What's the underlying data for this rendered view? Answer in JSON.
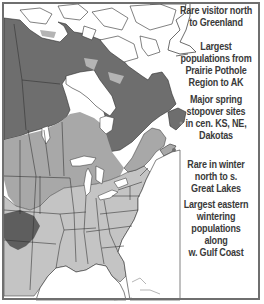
{
  "map": {
    "type": "species-range-map",
    "colors": {
      "water": "#ffffff",
      "non_range_land": "#ffffff",
      "breeding_range": "#6e6e6e",
      "migration_range": "#a8a8a8",
      "winter_range": "#c4c4c4",
      "year_round_dark": "#5a5a5a",
      "borders": "#2e2e2e",
      "frame": "#6f6f6f"
    },
    "annotations": [
      {
        "id": "greenland",
        "text": "Rare visitor north to Greenland"
      },
      {
        "id": "prairie",
        "text": "Largest populations from Prairie Pothole Region to AK"
      },
      {
        "id": "stopover",
        "text": "Major spring stopover sites in cen. KS, NE, Dakotas"
      },
      {
        "id": "great-lakes",
        "text": "Rare in winter north to s. Great Lakes"
      },
      {
        "id": "gulf",
        "text": "Largest eastern wintering populations along w. Gulf Coast"
      }
    ]
  },
  "notes": {
    "greenland_l1": "Rare visitor north",
    "greenland_l2": "to Greenland",
    "prairie_l1": "Largest",
    "prairie_l2": "populations from",
    "prairie_l3": "Prairie Pothole",
    "prairie_l4": "Region to AK",
    "stopover_l1": "Major spring",
    "stopover_l2": "stopover sites",
    "stopover_l3": "in cen. KS, NE,",
    "stopover_l4": "Dakotas",
    "lakes_l1": "Rare in winter",
    "lakes_l2": "north to s.",
    "lakes_l3": "Great Lakes",
    "gulf_l1": "Largest eastern",
    "gulf_l2": "wintering",
    "gulf_l3": "populations along",
    "gulf_l4": "w. Gulf Coast"
  }
}
